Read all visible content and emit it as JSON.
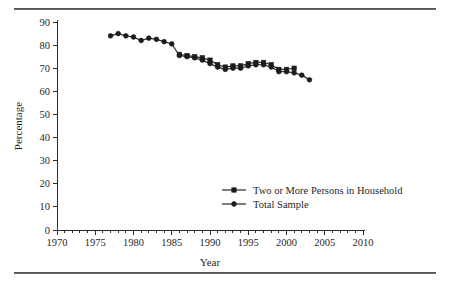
{
  "figure": {
    "top_rule": "horizontal-rule",
    "bottom_rule": "horizontal-rule"
  },
  "chart_data": {
    "type": "line",
    "title": "",
    "xlabel": "Year",
    "ylabel": "Percentage",
    "xlim": [
      1970,
      2010
    ],
    "ylim": [
      0,
      90
    ],
    "xticks": [
      1970,
      1975,
      1980,
      1985,
      1990,
      1995,
      2000,
      2005,
      2010
    ],
    "xtick_labels": [
      "1970",
      "1975",
      "1980",
      "1985",
      "1990",
      "1995",
      "2000",
      "2005",
      "2010"
    ],
    "xminor_step": 1,
    "yticks": [
      0,
      10,
      20,
      30,
      40,
      50,
      60,
      70,
      80,
      90
    ],
    "ytick_labels": [
      "0",
      "10",
      "20",
      "30",
      "40",
      "50",
      "60",
      "70",
      "80",
      "90"
    ],
    "grid": false,
    "legend_position": "lower-right-inside",
    "series": [
      {
        "name": "Two or More Persons in Household",
        "marker": "square",
        "color": "#1b1b1b",
        "x": [
          1986,
          1987,
          1988,
          1989,
          1990,
          1991,
          1992,
          1993,
          1994,
          1995,
          1996,
          1997,
          1998,
          1999,
          2000,
          2001
        ],
        "values": [
          76,
          75.5,
          75,
          74.5,
          73.5,
          71.5,
          70.5,
          71,
          71,
          72,
          72.5,
          72.5,
          71.5,
          69.5,
          69.5,
          70
        ]
      },
      {
        "name": "Total Sample",
        "marker": "circle",
        "color": "#1b1b1b",
        "x": [
          1977,
          1978,
          1979,
          1980,
          1981,
          1982,
          1983,
          1984,
          1985,
          1986,
          1987,
          1988,
          1989,
          1990,
          1991,
          1992,
          1993,
          1994,
          1995,
          1996,
          1997,
          1998,
          1999,
          2000,
          2001,
          2002,
          2003
        ],
        "values": [
          84,
          85,
          84,
          83.5,
          82,
          83,
          82.5,
          81.5,
          80.5,
          75.5,
          75,
          74.5,
          73.5,
          72,
          70.5,
          69.5,
          70,
          70,
          71,
          71.5,
          71.5,
          70.5,
          68.5,
          68.5,
          68,
          67,
          65
        ]
      }
    ]
  }
}
